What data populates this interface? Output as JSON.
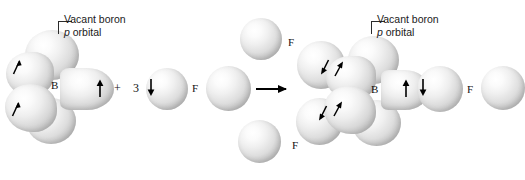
{
  "figure": {
    "type": "orbital-reaction-diagram"
  },
  "callouts": {
    "left": {
      "line1": "Vacant boron",
      "line2_italic": "p",
      "line2_rest": " orbital"
    },
    "right": {
      "line1": "Vacant boron",
      "line2_italic": "p",
      "line2_rest": " orbital"
    }
  },
  "atom_labels": {
    "boron_left": "B",
    "boron_right": "B",
    "fluorine_reactant_1": "F",
    "fluorine_product_top": "F",
    "fluorine_product_bottom": "F",
    "fluorine_product_right": "F"
  },
  "operators": {
    "plus": "+",
    "coefficient": "3",
    "reaction_arrow": "reaction-arrow"
  },
  "electrons": {
    "left_structure": [
      {
        "id": "lobe-upper-left",
        "spin": "up"
      },
      {
        "id": "lobe-lower-left",
        "spin": "up"
      },
      {
        "id": "lobe-right",
        "spin": "up"
      }
    ],
    "fluorine_reactant": [
      {
        "id": "f-reactant-1",
        "spin": "down"
      }
    ],
    "right_structure": [
      {
        "id": "bond-upper-left-a",
        "spin": "down"
      },
      {
        "id": "bond-upper-left-b",
        "spin": "up"
      },
      {
        "id": "bond-lower-left-a",
        "spin": "down"
      },
      {
        "id": "bond-lower-left-b",
        "spin": "up"
      },
      {
        "id": "bond-right-a",
        "spin": "up"
      },
      {
        "id": "bond-right-b",
        "spin": "down"
      }
    ]
  },
  "colors": {
    "sphere_highlight": "#ffffff",
    "sphere_shadow": "#a2a2a2",
    "ink": "#111111",
    "background": "#ffffff"
  }
}
